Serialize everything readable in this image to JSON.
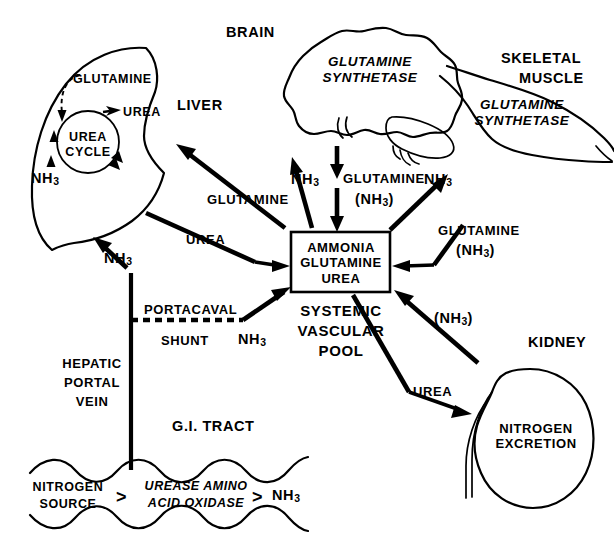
{
  "figure": {
    "kind": "physiology-flow-diagram",
    "line_color": "#000000",
    "background_color": "#ffffff"
  },
  "organs": {
    "liver": {
      "title": "LIVER",
      "cycle_label_line1": "UREA",
      "cycle_label_line2": "CYCLE",
      "internal_glutamine": "GLUTAMINE",
      "internal_urea": "UREA",
      "internal_ammonia": "NH",
      "internal_ammonia_sub": "3"
    },
    "brain": {
      "title": "BRAIN",
      "enzyme_line1": "GLUTAMINE",
      "enzyme_line2": "SYNTHETASE"
    },
    "skeletal_muscle": {
      "title_line1": "SKELETAL",
      "title_line2": "MUSCLE",
      "enzyme_line1": "GLUTAMINE",
      "enzyme_line2": "SYNTHETASE"
    },
    "kidney": {
      "title": "KIDNEY",
      "function_line1": "NITROGEN",
      "function_line2": "EXCRETION"
    },
    "gi_tract": {
      "title": "G.I. TRACT",
      "substrate_line1": "NITROGEN",
      "substrate_line2": "SOURCE",
      "arrow_glyph_1": ">",
      "enzymes_line1": "UREASE  AMINO",
      "enzymes_line2": "ACID  OXIDASE",
      "arrow_glyph_2": ">",
      "product": "NH",
      "product_sub": "3"
    }
  },
  "pool": {
    "box_line1": "AMMONIA",
    "box_line2": "GLUTAMINE",
    "box_line3": "UREA",
    "caption_line1": "SYSTEMIC",
    "caption_line2": "VASCULAR",
    "caption_line3": "POOL"
  },
  "vessels": {
    "portacaval_shunt_line1": "PORTACAVAL",
    "portacaval_shunt_line2": "SHUNT",
    "portacaval_shunt_species": "NH",
    "portacaval_shunt_species_sub": "3",
    "hepatic_portal_vein_line1": "HEPATIC",
    "hepatic_portal_vein_line2": "PORTAL",
    "hepatic_portal_vein_line3": "VEIN",
    "portal_species": "NH",
    "portal_species_sub": "3"
  },
  "flows": {
    "liver_to_pool_glutamine": "GLUTAMINE",
    "liver_to_pool_urea": "UREA",
    "brain_ammonia": "NH",
    "brain_ammonia_sub": "3",
    "brain_glutamine_line1": "GLUTAMINE",
    "brain_glutamine_line2": "(NH",
    "brain_glutamine_line2_sub": "3",
    "brain_glutamine_line2_end": ")",
    "muscle_ammonia": "NH",
    "muscle_ammonia_sub": "3",
    "muscle_glutamine_line1": "GLUTAMINE",
    "muscle_glutamine_line2": "(NH",
    "muscle_glutamine_line2_sub": "3",
    "muscle_glutamine_line2_end": ")",
    "kidney_ammonia_open": "(NH",
    "kidney_ammonia_sub": "3",
    "kidney_ammonia_close": ")",
    "kidney_urea": "UREA"
  }
}
